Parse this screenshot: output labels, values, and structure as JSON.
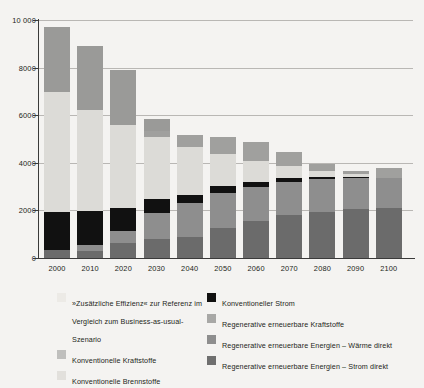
{
  "chart_data": {
    "type": "bar",
    "stacked": true,
    "title": "",
    "xlabel": "",
    "ylabel": "",
    "ylim": [
      0,
      10000
    ],
    "yticks": [
      0,
      2000,
      4000,
      6000,
      8000,
      10000
    ],
    "ytick_labels": [
      "0",
      "2000",
      "4000",
      "6000",
      "8000",
      "10 000"
    ],
    "grid": true,
    "legend_position": "bottom",
    "categories": [
      "2000",
      "2010",
      "2020",
      "2030",
      "2040",
      "2050",
      "2060",
      "2070",
      "2080",
      "2090",
      "2100"
    ],
    "series": [
      {
        "name": "Regenerative erneuerbare Energien – Strom direkt",
        "color": "#6b6b6b",
        "values": [
          330,
          300,
          620,
          800,
          900,
          1250,
          1550,
          1800,
          1950,
          2050,
          2100
        ]
      },
      {
        "name": "Regenerative erneuerbare Energien – Wärme direkt",
        "color": "#8e8e8e",
        "values": [
          0,
          260,
          520,
          1100,
          1400,
          1500,
          1450,
          1400,
          1350,
          1300,
          1250
        ]
      },
      {
        "name": "Konventioneller Strom",
        "color": "#111111",
        "values": [
          1600,
          1430,
          980,
          600,
          360,
          260,
          200,
          160,
          120,
          60,
          0
        ]
      },
      {
        "name": "Konventionelle Brennstoffe",
        "color": "#dcdbd7",
        "values": [
          5050,
          4220,
          3450,
          2600,
          1990,
          1340,
          880,
          510,
          230,
          110,
          0
        ]
      },
      {
        "name": "Konventionelle Kraftstoffe",
        "color": "#bfbfbd",
        "values": [
          0,
          0,
          0,
          0,
          0,
          0,
          0,
          0,
          0,
          0,
          0
        ]
      },
      {
        "name": "Regenerative erneuerbare Kraftstoffe",
        "color": "#a0a09e",
        "values": [
          0,
          0,
          0,
          240,
          520,
          720,
          790,
          590,
          280,
          130,
          420
        ]
      },
      {
        "name": "»Zusätzliche Effizienz« zur Referenz im Vergleich zum Business-as-usual-Szenario",
        "color": "#9a9a98",
        "values": [
          2740,
          2680,
          2330,
          510,
          0,
          0,
          0,
          0,
          0,
          0,
          0
        ]
      }
    ],
    "totals": [
      9720,
      8890,
      7900,
      5850,
      5170,
      5070,
      4870,
      4460,
      3930,
      3650,
      3770
    ]
  },
  "axis": {
    "y_labels": [
      "10 000",
      "8000",
      "6000",
      "4000",
      "2000",
      "0"
    ],
    "x_labels": [
      "2000",
      "2010",
      "2020",
      "2030",
      "2040",
      "2050",
      "2060",
      "2070",
      "2080",
      "2090",
      "2100"
    ]
  },
  "legend": {
    "left": [
      {
        "label": "»Zusätzliche Effizienz« zur Referenz im Vergleich zum Business-as-usual-Szenario",
        "color": "#eceae6"
      },
      {
        "label": "Konventionelle Kraftstoffe",
        "color": "#bfbfbd"
      },
      {
        "label": "Konventionelle Brennstoffe",
        "color": "#e2e0dc"
      }
    ],
    "right": [
      {
        "label": "Konventioneller Strom",
        "color": "#111111"
      },
      {
        "label": "Regenerative erneuerbare Kraftstoffe",
        "color": "#a8a8a6"
      },
      {
        "label": "Regenerative erneuerbare Energien – Wärme direkt",
        "color": "#8e8e8e"
      },
      {
        "label": "Regenerative erneuerbare Energien – Strom direkt",
        "color": "#6f6f6f"
      }
    ]
  }
}
